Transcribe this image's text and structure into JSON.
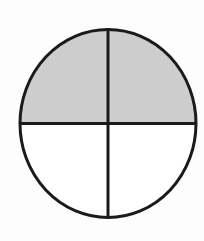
{
  "figure": {
    "name": "fraction-circle-diagram",
    "background_color": "#fdfdfd"
  },
  "chart_data": {
    "type": "pie",
    "title": "",
    "subtitle": "",
    "xlabel": "",
    "ylabel": "",
    "legend_position": "none",
    "grid": false,
    "annotations": [],
    "total_parts": 4,
    "shaded_parts": 2,
    "fraction_shaded": "2/4",
    "fraction_simplified": "1/2",
    "percent_shaded": 50,
    "categories": [
      "upper-left",
      "lower-left",
      "upper-right",
      "lower-right"
    ],
    "values": [
      25,
      25,
      25,
      25
    ],
    "tick_labels": [],
    "slices": [
      {
        "name": "upper-left",
        "label": "",
        "start_angle": 180,
        "end_angle": 270,
        "sweep": 90,
        "value": 25,
        "shaded": true,
        "fill": "#cdcdcd"
      },
      {
        "name": "upper-right",
        "label": "",
        "start_angle": 270,
        "end_angle": 360,
        "sweep": 90,
        "value": 25,
        "shaded": false,
        "fill": "#ffffff"
      },
      {
        "name": "lower-right",
        "label": "",
        "start_angle": 0,
        "end_angle": 90,
        "sweep": 90,
        "value": 25,
        "shaded": false,
        "fill": "#ffffff"
      },
      {
        "name": "lower-left",
        "label": "",
        "start_angle": 90,
        "end_angle": 180,
        "sweep": 90,
        "value": 25,
        "shaded": true,
        "fill": "#cdcdcd"
      }
    ]
  },
  "geometry": {
    "center_x": 108,
    "center_y": 123.5,
    "radius_x": 88,
    "radius_y": 94,
    "outline_width": 3,
    "divider_width": 3
  },
  "colors": {
    "shaded_fill": "#cdcdcd",
    "unshaded_fill": "#ffffff",
    "stroke": "#1a1a1a",
    "background": "#fdfdfd"
  }
}
